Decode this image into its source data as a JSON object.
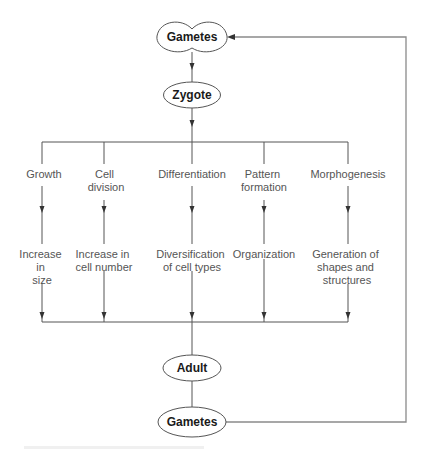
{
  "diagram": {
    "colors": {
      "line": "#555555",
      "feedback_line": "#8a8a8a",
      "node_text": "#1a1a1a",
      "process_text": "#555555"
    },
    "nodes": {
      "gametes_top": "Gametes",
      "zygote": "Zygote",
      "adult": "Adult",
      "gametes_bottom": "Gametes"
    },
    "branches": [
      {
        "process": [
          "Growth"
        ],
        "outcome": [
          "Increase",
          "in",
          "size"
        ]
      },
      {
        "process": [
          "Cell",
          "division"
        ],
        "outcome": [
          "Increase in",
          "cell number"
        ]
      },
      {
        "process": [
          "Differentiation"
        ],
        "outcome": [
          "Diversification",
          "of cell types"
        ]
      },
      {
        "process": [
          "Pattern",
          "formation"
        ],
        "outcome": [
          "Organization"
        ]
      },
      {
        "process": [
          "Morphogenesis"
        ],
        "outcome": [
          "Generation of",
          "shapes and",
          "structures"
        ]
      }
    ],
    "edges": [
      "Gametes -> Zygote",
      "Zygote -> Growth, Cell division, Differentiation, Pattern formation, Morphogenesis",
      "Growth -> Increase in size",
      "Cell division -> Increase in cell number",
      "Differentiation -> Diversification of cell types",
      "Pattern formation -> Organization",
      "Morphogenesis -> Generation of shapes and structures",
      "All outcomes -> Adult",
      "Adult -> Gametes",
      "Gametes (bottom) -> Gametes (top)"
    ]
  }
}
